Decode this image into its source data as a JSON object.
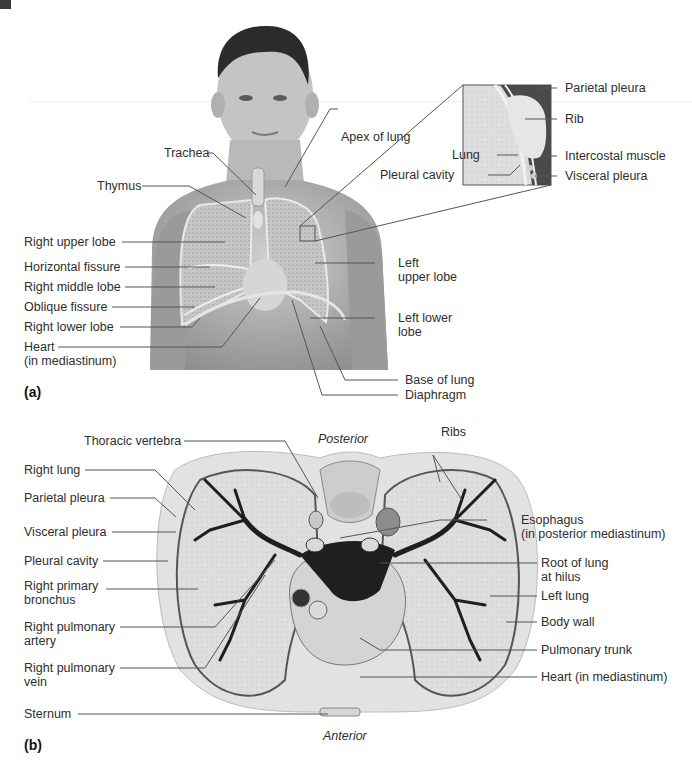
{
  "figure": {
    "panel_a_label": "(a)",
    "panel_b_label": "(b)"
  },
  "panel_a": {
    "labels": {
      "trachea": "Trachea",
      "apex_of_lung": "Apex of lung",
      "thymus": "Thymus",
      "right_upper_lobe": "Right upper lobe",
      "horizontal_fissure": "Horizontal fissure",
      "right_middle_lobe": "Right middle lobe",
      "oblique_fissure": "Oblique fissure",
      "right_lower_lobe": "Right lower lobe",
      "heart_line1": "Heart",
      "heart_line2": "(in mediastinum)",
      "left_upper_lobe_line1": "Left",
      "left_upper_lobe_line2": "upper lobe",
      "left_lower_lobe_line1": "Left lower",
      "left_lower_lobe_line2": "lobe",
      "base_of_lung": "Base of lung",
      "diaphragm": "Diaphragm"
    },
    "inset": {
      "parietal_pleura": "Parietal pleura",
      "rib": "Rib",
      "lung": "Lung",
      "intercostal_muscle": "Intercostal muscle",
      "pleural_cavity": "Pleural cavity",
      "visceral_pleura": "Visceral pleura"
    }
  },
  "panel_b": {
    "orientation": {
      "posterior": "Posterior",
      "anterior": "Anterior"
    },
    "labels": {
      "thoracic_vertebra": "Thoracic vertebra",
      "ribs": "Ribs",
      "right_lung": "Right lung",
      "parietal_pleura": "Parietal pleura",
      "visceral_pleura": "Visceral pleura",
      "esophagus_line1": "Esophagus",
      "esophagus_line2": "(in posterior mediastinum)",
      "pleural_cavity": "Pleural cavity",
      "right_primary_bronchus_line1": "Right primary",
      "right_primary_bronchus_line2": "bronchus",
      "root_of_lung_line1": "Root of lung",
      "root_of_lung_line2": "at hilus",
      "left_lung": "Left lung",
      "right_pulmonary_artery_line1": "Right pulmonary",
      "right_pulmonary_artery_line2": "artery",
      "body_wall": "Body wall",
      "pulmonary_trunk": "Pulmonary trunk",
      "right_pulmonary_vein_line1": "Right pulmonary",
      "right_pulmonary_vein_line2": "vein",
      "heart": "Heart (in mediastinum)",
      "sternum": "Sternum"
    }
  },
  "colors": {
    "leader_line": "#555555",
    "skin_light": "#cfcfcf",
    "skin_dark": "#8a8a8a",
    "lung_fill": "#c9c9c9",
    "section_fill": "#e4e4e4",
    "bronchi": "#1e1e1e"
  }
}
